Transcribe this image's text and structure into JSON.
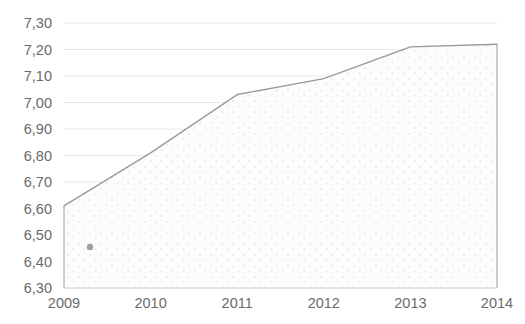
{
  "chart_data": {
    "type": "area",
    "title": "",
    "subtitle": "",
    "xlabel": "",
    "ylabel": "",
    "categories": [
      "2009",
      "2010",
      "2011",
      "2012",
      "2013",
      "2014"
    ],
    "x": [
      2009,
      2010,
      2011,
      2012,
      2013,
      2014
    ],
    "values": [
      6.61,
      6.81,
      7.03,
      7.09,
      7.21,
      7.22
    ],
    "value_labels": [
      "6,61",
      "6,81",
      "7,03",
      "7,09",
      "7,21",
      "7,22"
    ],
    "series": [
      {
        "name": "",
        "values": [
          6.61,
          6.81,
          7.03,
          7.09,
          7.21,
          7.22
        ]
      }
    ],
    "xlim": [
      2009,
      2014
    ],
    "ylim": [
      6.3,
      7.3
    ],
    "ytick_step": 0.1,
    "ytick_labels": [
      "6,30",
      "6,40",
      "6,50",
      "6,60",
      "6,70",
      "6,80",
      "6,90",
      "7,00",
      "7,10",
      "7,20",
      "7,30"
    ],
    "ytick_values": [
      6.3,
      6.4,
      6.5,
      6.6,
      6.7,
      6.8,
      6.9,
      7.0,
      7.1,
      7.2,
      7.3
    ],
    "xtick_labels": [
      "2009",
      "2010",
      "2011",
      "2012",
      "2013",
      "2014"
    ],
    "decimal_separator": ",",
    "grid": {
      "horizontal": true,
      "vertical": false,
      "color": "#e8e8e8"
    },
    "legend": {
      "visible": false,
      "position": "none",
      "entries": []
    },
    "style": {
      "line_color": "#9a9a9a",
      "line_width": 1.4,
      "fill_pattern": "dotted-stipple",
      "fill_color": "#fbfbfb",
      "fill_dot_color": "#dcdcdc",
      "axis_color": "#d0d0d0",
      "tick_label_color": "#6b6b6b",
      "background": "#ffffff"
    },
    "annotations": [
      {
        "name": "stray-dot-marker",
        "x": 2009.3,
        "y": 6.455,
        "color": "#808080",
        "radius": 3.2
      }
    ]
  }
}
